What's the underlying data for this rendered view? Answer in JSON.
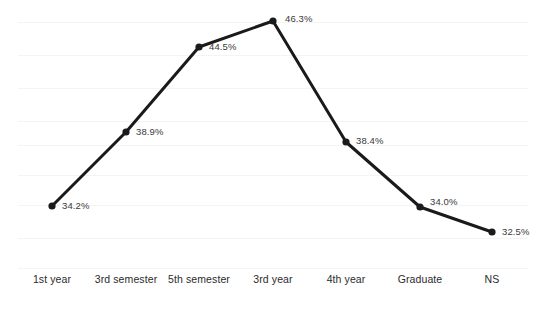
{
  "chart_data": {
    "type": "line",
    "title": "",
    "subtitle": "",
    "xlabel": "",
    "ylabel": "",
    "categories": [
      "1st year",
      "3rd semester",
      "5th semester",
      "3rd year",
      "4th year",
      "Graduate",
      "NS"
    ],
    "values": [
      34.2,
      38.9,
      44.5,
      46.3,
      38.4,
      34.0,
      32.5
    ],
    "data_labels": [
      "34.2%",
      "38.9%",
      "44.5%",
      "46.3%",
      "38.4%",
      "34.0%",
      "32.5%"
    ],
    "series": [
      {
        "name": "",
        "values": [
          34.2,
          38.9,
          44.5,
          46.3,
          38.4,
          34.0,
          32.5
        ]
      }
    ],
    "ylim": [
      31.0,
      47.5
    ],
    "grid": true,
    "grid_orientation": "horizontal",
    "legend": false,
    "legend_position": "none",
    "line_color": "#1a1a1a",
    "marker_color": "#1a1a1a",
    "grid_color": "#f4f4f4",
    "background_color": "#ffffff",
    "label_color": "#3a3a3a",
    "axis_label_color": "#2b2b2b"
  },
  "layout": {
    "point_x": [
      52,
      126,
      199,
      273,
      346,
      420,
      492
    ],
    "point_y": [
      206,
      132,
      47,
      21,
      142,
      207,
      232
    ],
    "label_x": [
      62,
      136,
      209,
      285,
      356,
      430,
      502
    ],
    "label_y": [
      201,
      127,
      42,
      14,
      136,
      197,
      227
    ],
    "gridline_y": [
      22,
      55,
      88,
      121,
      145,
      175,
      205,
      238,
      268
    ],
    "tick_x": [
      52,
      126,
      199,
      273,
      346,
      420,
      492
    ]
  }
}
